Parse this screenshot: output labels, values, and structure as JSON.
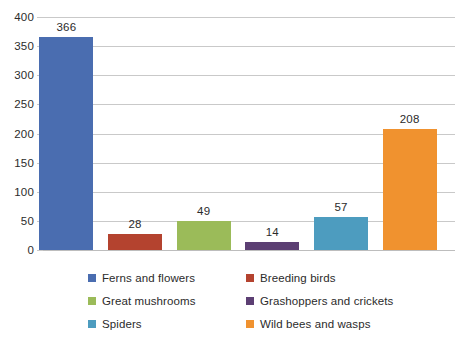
{
  "chart_data": {
    "type": "bar",
    "title": "",
    "subtitle": "",
    "xlabel": "",
    "ylabel": "",
    "categories": [
      "Ferns and flowers",
      "Breeding birds",
      "Great mushrooms",
      "Grashoppers and crickets",
      "Spiders",
      "Wild bees and wasps"
    ],
    "values": [
      366,
      28,
      49,
      14,
      57,
      208
    ],
    "data_labels": [
      "366",
      "28",
      "49",
      "14",
      "57",
      "208"
    ],
    "ylim": [
      0,
      400
    ],
    "ytick_step": 50,
    "ytick_labels": [
      "400",
      "350",
      "300",
      "250",
      "200",
      "150",
      "100",
      "50",
      "0"
    ],
    "ytick_values": [
      400,
      350,
      300,
      250,
      200,
      150,
      100,
      50,
      0
    ],
    "xtick_labels": [],
    "grid": "horizontal",
    "legend_position": "bottom",
    "legend": [
      {
        "label": "Ferns and flowers",
        "color": "#4A6DB0"
      },
      {
        "label": "Breeding birds",
        "color": "#B4432F"
      },
      {
        "label": "Great mushrooms",
        "color": "#9BBB59"
      },
      {
        "label": "Grashoppers and crickets",
        "color": "#5C3F73"
      },
      {
        "label": "Spiders",
        "color": "#4D9CBF"
      },
      {
        "label": "Wild bees and wasps",
        "color": "#F0922F"
      }
    ],
    "series": [
      {
        "name": "Species counts",
        "points": [
          {
            "category": "Ferns and flowers",
            "value": 366,
            "color": "#4A6DB0"
          },
          {
            "category": "Breeding birds",
            "value": 28,
            "color": "#B4432F"
          },
          {
            "category": "Great mushrooms",
            "value": 49,
            "color": "#9BBB59"
          },
          {
            "category": "Grashoppers and crickets",
            "value": 14,
            "color": "#5C3F73"
          },
          {
            "category": "Spiders",
            "value": 57,
            "color": "#4D9CBF"
          },
          {
            "category": "Wild bees and wasps",
            "value": 208,
            "color": "#F0922F"
          }
        ]
      }
    ],
    "colors": {
      "gridline": "#C9C9C9",
      "axis_text": "#2B2B2B",
      "background": "#FFFFFF"
    }
  }
}
